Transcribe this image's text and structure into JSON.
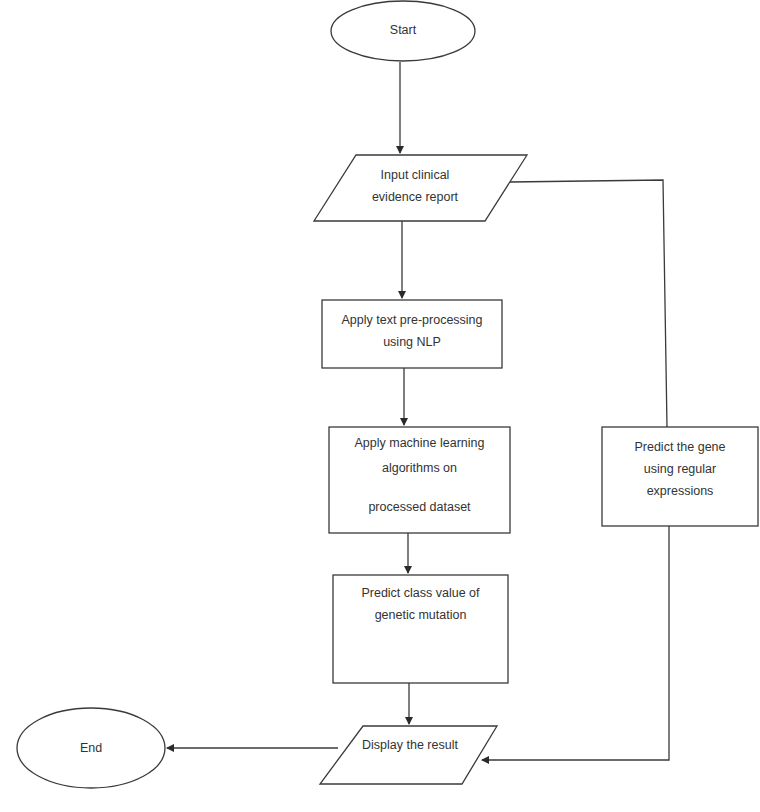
{
  "diagram": {
    "type": "flowchart",
    "colors": {
      "stroke": "#3a3a3a",
      "text": "#333333",
      "background": "#ffffff"
    },
    "nodes": {
      "start": {
        "shape": "ellipse",
        "lines": [
          "Start"
        ]
      },
      "input": {
        "shape": "parallelogram",
        "lines": [
          "Input clinical",
          "evidence report"
        ]
      },
      "preprocess": {
        "shape": "rectangle",
        "lines": [
          "Apply text pre-processing",
          "using NLP"
        ]
      },
      "ml": {
        "shape": "rectangle",
        "lines": [
          "Apply machine learning",
          "algorithms on",
          "processed dataset"
        ]
      },
      "predict_class": {
        "shape": "rectangle",
        "lines": [
          "Predict class value of",
          "genetic mutation"
        ]
      },
      "predict_gene": {
        "shape": "rectangle",
        "lines": [
          "Predict the gene",
          "using regular",
          "expressions"
        ]
      },
      "display": {
        "shape": "parallelogram",
        "lines": [
          "Display the result"
        ]
      },
      "end": {
        "shape": "ellipse",
        "lines": [
          "End"
        ]
      }
    },
    "edges": [
      {
        "from": "start",
        "to": "input"
      },
      {
        "from": "input",
        "to": "preprocess"
      },
      {
        "from": "preprocess",
        "to": "ml"
      },
      {
        "from": "ml",
        "to": "predict_class"
      },
      {
        "from": "predict_class",
        "to": "display"
      },
      {
        "from": "input",
        "to": "predict_gene"
      },
      {
        "from": "predict_gene",
        "to": "display"
      },
      {
        "from": "display",
        "to": "end"
      }
    ]
  }
}
